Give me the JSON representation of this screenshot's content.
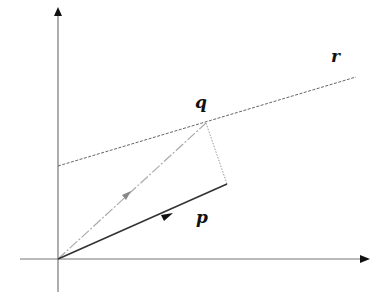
{
  "diagram": {
    "type": "vector-projection",
    "origin": [
      58,
      259
    ],
    "colors": {
      "axis": "#777777",
      "axis_arrow": "#111111",
      "vector_p": "#333333",
      "vector_q": "#aaaaaa",
      "line_r": "#666666",
      "projection_dotted": "#999999",
      "label": "#111111"
    },
    "axes": {
      "x": {
        "from": [
          20,
          259
        ],
        "to": [
          366,
          259
        ]
      },
      "y": {
        "from": [
          58,
          292
        ],
        "to": [
          58,
          10
        ]
      }
    },
    "line_r": {
      "from": [
        58,
        166
      ],
      "to": [
        356,
        77
      ],
      "style": "dashed"
    },
    "vector_q": {
      "from": [
        58,
        259
      ],
      "to": [
        206,
        123
      ],
      "style": "dash-dot",
      "arrow_at": [
        127,
        195
      ]
    },
    "vector_p": {
      "from": [
        58,
        259
      ],
      "to": [
        227,
        184
      ],
      "style": "solid",
      "arrow_at": [
        167,
        216
      ]
    },
    "projection": {
      "from": [
        206,
        123
      ],
      "to": [
        227,
        184
      ],
      "style": "dotted"
    },
    "labels": {
      "q": "q",
      "r": "r",
      "p": "p"
    }
  }
}
